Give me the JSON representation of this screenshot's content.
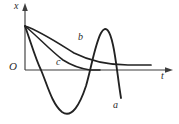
{
  "figure": {
    "kind": "line-plot",
    "background_color": "#ffffff",
    "stroke_color": "#222222",
    "axis_color": "#3d3d3d"
  },
  "axes": {
    "vertical": {
      "label": "x",
      "name": "displacement-axis",
      "origin_px": [
        25,
        70
      ],
      "tip_px": [
        25,
        5
      ]
    },
    "horizontal": {
      "label": "t",
      "name": "time-axis",
      "origin_px": [
        25,
        70
      ],
      "tip_px": [
        172,
        70
      ]
    },
    "origin": {
      "label": "O"
    }
  },
  "curve_labels": {
    "a": "a",
    "b": "b",
    "c": "c"
  },
  "chart_data": {
    "type": "line",
    "title": "",
    "xlabel": "t",
    "ylabel": "x",
    "grid": false,
    "legend": "inline-curve-labels",
    "xlim": [
      0,
      147
    ],
    "ylim": [
      -42,
      44
    ],
    "common_start_point": [
      0,
      44
    ],
    "series": [
      {
        "name": "a",
        "label": "a",
        "description": "underdamped oscillation crossing the axis repeatedly",
        "path_px": "M25,26 C32,46 36,60 41,70 C47,84 52,104 62,112 C72,119 80,104 86,86 C91,69 95,44 101,33 C106,24 110,31 113,45 C116,58 118,80 121,98",
        "points": [
          [
            0,
            44
          ],
          [
            16,
            0
          ],
          [
            37,
            -42
          ],
          [
            61,
            0
          ],
          [
            76,
            11
          ],
          [
            88,
            -28
          ]
        ]
      },
      {
        "name": "b",
        "label": "b",
        "description": "overdamped slow exponential decay to zero",
        "path_px": "M25,26 C40,31 58,43 74,53 C92,62 112,65 128,65 C138,65 146,65 151,65",
        "points": [
          [
            0,
            44
          ],
          [
            49,
            17
          ],
          [
            87,
            5
          ],
          [
            126,
            5
          ]
        ]
      },
      {
        "name": "c",
        "label": "c",
        "description": "critically damped fastest non-oscillatory decay to zero",
        "path_px": "M25,26 C37,36 52,52 63,60 C74,67 83,69 90,70 C94,70 98,70 100,70",
        "points": [
          [
            0,
            44
          ],
          [
            38,
            10
          ],
          [
            65,
            1
          ],
          [
            75,
            0
          ]
        ]
      }
    ]
  }
}
